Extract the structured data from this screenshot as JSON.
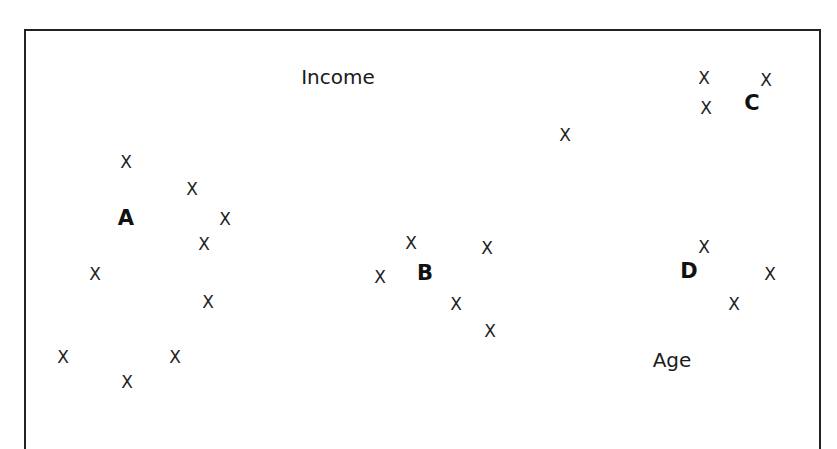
{
  "diagram": {
    "marker_glyph": "X",
    "axis_labels": {
      "income": {
        "text": "Income",
        "x": 338,
        "y": 77
      },
      "age": {
        "text": "Age",
        "x": 672,
        "y": 360
      }
    },
    "clusters": [
      {
        "label": "A",
        "x": 126,
        "y": 218,
        "points": [
          [
            126,
            162
          ],
          [
            192,
            189
          ],
          [
            225,
            219
          ],
          [
            204,
            244
          ],
          [
            95,
            274
          ],
          [
            208,
            302
          ],
          [
            63,
            357
          ],
          [
            175,
            357
          ],
          [
            127,
            382
          ]
        ]
      },
      {
        "label": "B",
        "x": 425,
        "y": 273,
        "points": [
          [
            411,
            243
          ],
          [
            487,
            248
          ],
          [
            380,
            277
          ],
          [
            456,
            304
          ],
          [
            490,
            331
          ]
        ]
      },
      {
        "label": "C",
        "x": 752,
        "y": 103,
        "points": [
          [
            704,
            78
          ],
          [
            766,
            80
          ],
          [
            706,
            108
          ],
          [
            565,
            135
          ]
        ]
      },
      {
        "label": "D",
        "x": 689,
        "y": 271,
        "points": [
          [
            704,
            247
          ],
          [
            770,
            274
          ],
          [
            734,
            304
          ]
        ]
      }
    ],
    "colors": {
      "border": "#222222",
      "text": "#1a1a1a",
      "background": "#ffffff"
    }
  }
}
